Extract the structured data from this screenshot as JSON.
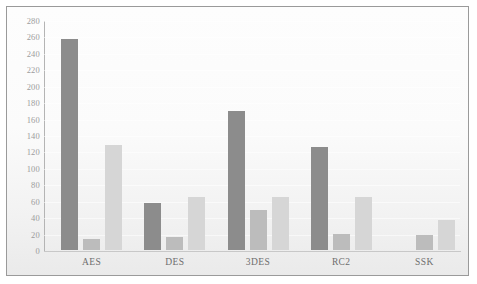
{
  "chart_data": {
    "type": "bar",
    "title": "",
    "subtitle": "",
    "xlabel": "",
    "ylabel": "",
    "categories": [
      "AES",
      "DES",
      "3DES",
      "RC2",
      "SSK"
    ],
    "series": [
      {
        "name": "series-1",
        "color": "#8c8c8c",
        "values": [
          257,
          57,
          169,
          125,
          0
        ]
      },
      {
        "name": "series-2",
        "color": "#bcbcbc",
        "values": [
          13,
          16,
          49,
          19,
          18
        ]
      },
      {
        "name": "series-3",
        "color": "#d6d6d6",
        "values": [
          128,
          65,
          65,
          65,
          36
        ]
      }
    ],
    "ylim": [
      0,
      280
    ],
    "ytick_step": 20,
    "yticks": [
      0,
      20,
      40,
      60,
      80,
      100,
      120,
      140,
      160,
      180,
      200,
      220,
      240,
      260,
      280
    ],
    "ytick_labels": [
      "0",
      "20",
      "40",
      "60",
      "80",
      "100",
      "120",
      "140",
      "160",
      "180",
      "200",
      "220",
      "240",
      "260",
      "280"
    ],
    "grid": true,
    "legend": false,
    "legend_position": "none",
    "annotations": []
  },
  "colors": {
    "series_1": "#8c8c8c",
    "series_2": "#bcbcbc",
    "series_3": "#d6d6d6",
    "frame_border": "#9a9a9a",
    "axis": "#b4b4b4",
    "tick_text": "#9c9c9c",
    "category_text": "#6e6e6e",
    "background": "#fbfbfb"
  }
}
